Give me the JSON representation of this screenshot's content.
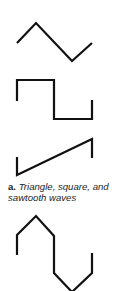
{
  "figure": {
    "caption_label": "a.",
    "caption_text": "Triangle, square, and sawtooth waves",
    "waves": [
      {
        "name": "triangle",
        "points": "17,43 36,23 72,61 92,43"
      },
      {
        "name": "square",
        "points": "17,101 17,80 54,80 54,119 92,119 92,100"
      },
      {
        "name": "sawtooth",
        "points": "17,157 17,175 92,139 92,158"
      },
      {
        "name": "clipped-sine",
        "points": "17,255 17,235 36,216 54,236 54,273 72,292 92,273 92,253"
      }
    ],
    "stroke_color": "#111111"
  }
}
